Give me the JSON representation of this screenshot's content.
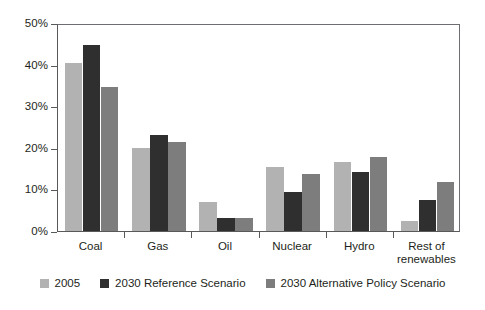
{
  "chart_data": {
    "type": "bar",
    "title": "",
    "subtitle": "",
    "xlabel": "",
    "ylabel": "",
    "ylim": [
      0,
      50
    ],
    "yticks": [
      0,
      10,
      20,
      30,
      40,
      50
    ],
    "ytick_labels": [
      "0%",
      "10%",
      "20%",
      "30%",
      "40%",
      "50%"
    ],
    "grid": false,
    "legend_position": "bottom",
    "categories": [
      "Coal",
      "Gas",
      "Oil",
      "Nuclear",
      "Hydro",
      "Rest of\nrenewables"
    ],
    "series": [
      {
        "name": "2005",
        "color": "#b2b2b2",
        "values": [
          40.3,
          20.0,
          6.9,
          15.5,
          16.6,
          2.5
        ]
      },
      {
        "name": "2030 Reference Scenario",
        "color": "#2f2f2f",
        "values": [
          44.7,
          23.0,
          3.2,
          9.4,
          14.2,
          7.4
        ]
      },
      {
        "name": "2030 Alternative Policy Scenario",
        "color": "#7d7d7d",
        "values": [
          34.5,
          21.5,
          3.2,
          13.8,
          17.9,
          11.9
        ]
      }
    ]
  },
  "axis": {
    "tick_unit": "%"
  },
  "colors": {
    "axis_line": "#58595b",
    "frame_line": "#6d6e71",
    "text": "#231f20",
    "background": "#ffffff"
  }
}
